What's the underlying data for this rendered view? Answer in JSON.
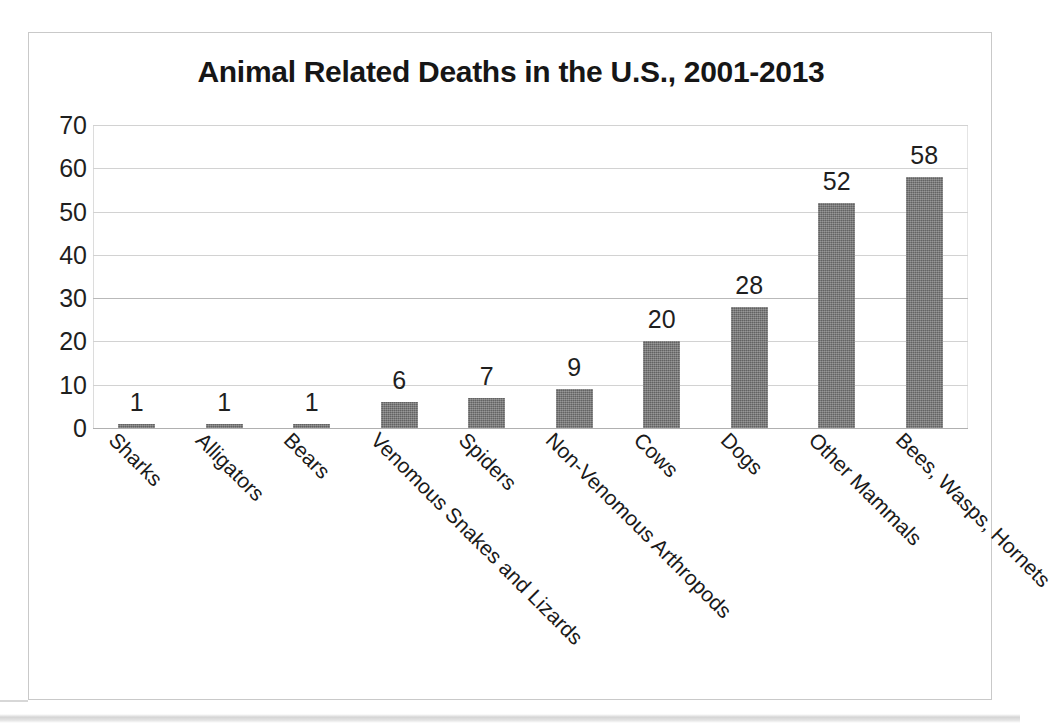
{
  "chart_data": {
    "type": "bar",
    "title": "Animal Related Deaths in the U.S., 2001-2013",
    "xlabel": "",
    "ylabel": "",
    "ylim": [
      0,
      70
    ],
    "ytick_step": 10,
    "ytick_labels": [
      "70",
      "60",
      "50",
      "40",
      "30",
      "20",
      "10",
      "0"
    ],
    "grid": true,
    "legend": false,
    "bar_color": "#6e6e6e",
    "categories": [
      "Sharks",
      "Alligators",
      "Bears",
      "Venomous Snakes and Lizards",
      "Spiders",
      "Non-Venomous Arthropods",
      "Cows",
      "Dogs",
      "Other Mammals",
      "Bees, Wasps, Hornets"
    ],
    "values": [
      1,
      1,
      1,
      6,
      7,
      9,
      20,
      28,
      52,
      58
    ],
    "data_labels": [
      "1",
      "1",
      "1",
      "6",
      "7",
      "9",
      "20",
      "28",
      "52",
      "58"
    ]
  }
}
